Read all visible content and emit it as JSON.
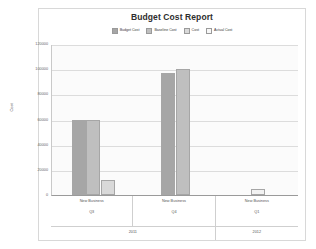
{
  "chart_data": {
    "type": "bar",
    "title": "Budget Cost Report",
    "xlabel": "",
    "ylabel": "Cost",
    "ylim": [
      0,
      120000
    ],
    "yticks": [
      0,
      20000,
      40000,
      60000,
      80000,
      100000,
      120000
    ],
    "ytick_labels": [
      "0",
      "20000",
      "40000",
      "60000",
      "80000",
      "100000",
      "120000"
    ],
    "grid": true,
    "legend_position": "top-center",
    "categories": [
      "New Business",
      "New Business",
      "New Business"
    ],
    "quarters": [
      "Q3",
      "Q4",
      "Q1"
    ],
    "years": [
      "2011",
      "2011",
      "2012"
    ],
    "year_groups": [
      {
        "label": "2011",
        "span": 2
      },
      {
        "label": "2012",
        "span": 1
      }
    ],
    "series": [
      {
        "name": "Budget Cost",
        "color": "#a6a6a6",
        "values": [
          60000,
          97000,
          0
        ]
      },
      {
        "name": "Baseline Cost",
        "color": "#bfbfbf",
        "values": [
          60000,
          100000,
          0
        ]
      },
      {
        "name": "Cost",
        "color": "#d9d9d9",
        "values": [
          12000,
          0,
          0
        ]
      },
      {
        "name": "Actual Cost",
        "color": "#f2f2f2",
        "values": [
          0,
          0,
          5000
        ]
      }
    ]
  },
  "legend": {
    "items": [
      {
        "label": "Budget Cost",
        "color": "#a6a6a6"
      },
      {
        "label": "Baseline Cost",
        "color": "#bfbfbf"
      },
      {
        "label": "Cost",
        "color": "#d9d9d9"
      },
      {
        "label": "Actual Cost",
        "color": "#f7f7f7"
      }
    ]
  }
}
